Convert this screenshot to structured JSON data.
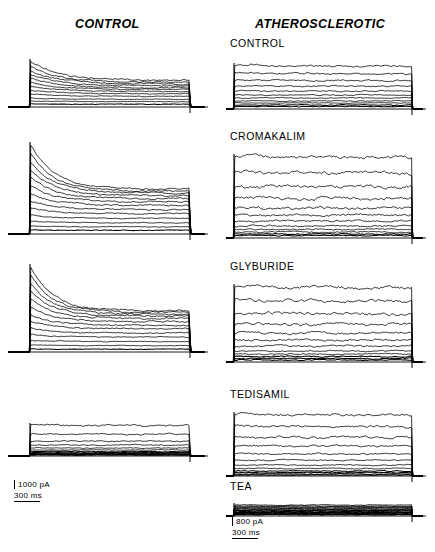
{
  "figure": {
    "width": 435,
    "height": 552,
    "background": "#ffffff",
    "ink": "#000000"
  },
  "headers": {
    "left": "CONTROL",
    "right": "ATHEROSCLEROTIC"
  },
  "panel_labels": {
    "right_control": "CONTROL",
    "right_cromakalim": "CROMAKALIM",
    "right_glyburide": "GLYBURIDE",
    "right_tedisamil": "TEDISAMIL",
    "right_tea": "TEA"
  },
  "scalebars": [
    {
      "id": "left-scalebar",
      "amplitude": "1000 pA",
      "time": "300 ms"
    },
    {
      "id": "right-scalebar",
      "amplitude": "800 pA",
      "time": "300 ms"
    }
  ],
  "chart_data": {
    "type": "line",
    "xlabel": "",
    "ylabel": "",
    "legend": "none",
    "grid": false,
    "series_units": {
      "current": "pA",
      "time": "ms"
    },
    "scale_reference": {
      "left_column": {
        "amplitude_pA": 1000,
        "time_ms": 300
      },
      "right_column": {
        "amplitude_pA": 800,
        "time_ms": 300
      }
    },
    "panels": [
      {
        "id": "left-control-1",
        "column": "CONTROL",
        "label": "",
        "x": 8,
        "y": 55,
        "w": 200,
        "h": 62,
        "baseline_y": 52,
        "step_x": 22,
        "end_x": 182,
        "tail_x": 196,
        "kind": "decay",
        "noise": 0.9,
        "peaks": [
          46,
          41,
          37,
          33,
          29,
          25,
          21,
          17,
          13,
          9,
          6,
          3
        ],
        "plateau_ratio": [
          0.58,
          0.6,
          0.62,
          0.64,
          0.66,
          0.7,
          0.74,
          0.78,
          0.82,
          0.86,
          0.9,
          0.94
        ],
        "decay_tau": 0.18
      },
      {
        "id": "left-control-2",
        "column": "CONTROL",
        "label": "",
        "x": 8,
        "y": 138,
        "w": 200,
        "h": 105,
        "baseline_y": 96,
        "step_x": 22,
        "end_x": 182,
        "tail_x": 196,
        "kind": "decay",
        "noise": 1.0,
        "peaks": [
          90,
          81,
          73,
          65,
          57,
          49,
          41,
          33,
          26,
          19,
          13,
          8,
          4
        ],
        "plateau_ratio": [
          0.5,
          0.53,
          0.56,
          0.59,
          0.62,
          0.66,
          0.7,
          0.74,
          0.78,
          0.82,
          0.86,
          0.9,
          0.94
        ],
        "decay_tau": 0.15
      },
      {
        "id": "left-control-3",
        "column": "CONTROL",
        "label": "",
        "x": 8,
        "y": 260,
        "w": 200,
        "h": 100,
        "baseline_y": 92,
        "step_x": 22,
        "end_x": 182,
        "tail_x": 196,
        "kind": "decay",
        "noise": 1.0,
        "peaks": [
          86,
          78,
          70,
          62,
          54,
          46,
          38,
          31,
          24,
          18,
          12,
          7,
          3
        ],
        "plateau_ratio": [
          0.48,
          0.51,
          0.54,
          0.58,
          0.62,
          0.66,
          0.7,
          0.75,
          0.79,
          0.83,
          0.87,
          0.91,
          0.95
        ],
        "decay_tau": 0.14
      },
      {
        "id": "left-control-4",
        "column": "CONTROL",
        "label": "",
        "x": 8,
        "y": 400,
        "w": 200,
        "h": 62,
        "baseline_y": 56,
        "step_x": 22,
        "end_x": 182,
        "tail_x": 196,
        "kind": "sustained",
        "noise": 1.3,
        "peaks": [
          31,
          22,
          15,
          11,
          8,
          6,
          4.5,
          3.5,
          2.5,
          2,
          1.5,
          1
        ],
        "plateau_ratio": [
          0.97,
          0.98,
          0.99,
          1.0,
          1.0,
          1.0,
          1.0,
          1.0,
          1.0,
          1.0,
          1.0,
          1.0
        ],
        "decay_tau": 0.9
      },
      {
        "id": "right-control",
        "column": "ATHEROSCLEROTIC",
        "label": "CONTROL",
        "x": 226,
        "y": 55,
        "w": 200,
        "h": 62,
        "baseline_y": 54,
        "step_x": 8,
        "end_x": 186,
        "tail_x": 196,
        "kind": "sustained",
        "noise": 1.2,
        "peaks": [
          44,
          36,
          29,
          23,
          18,
          14,
          11,
          8,
          6,
          4,
          2.5
        ],
        "plateau_ratio": [
          0.95,
          0.96,
          0.97,
          0.98,
          0.99,
          1.0,
          1.0,
          1.0,
          1.0,
          1.0,
          1.0
        ],
        "decay_tau": 0.8
      },
      {
        "id": "right-cromakalim",
        "column": "ATHEROSCLEROTIC",
        "label": "CROMAKALIM",
        "x": 226,
        "y": 148,
        "w": 200,
        "h": 98,
        "baseline_y": 90,
        "step_x": 8,
        "end_x": 186,
        "tail_x": 196,
        "kind": "sustained",
        "noise": 2.1,
        "peaks": [
          82,
          66,
          52,
          40,
          30,
          23,
          17,
          12,
          8.5,
          6,
          4,
          2.5
        ],
        "plateau_ratio": [
          0.97,
          0.98,
          0.98,
          0.99,
          1.0,
          1.0,
          1.0,
          1.0,
          1.0,
          1.0,
          1.0,
          1.0
        ],
        "decay_tau": 0.9
      },
      {
        "id": "right-glyburide",
        "column": "ATHEROSCLEROTIC",
        "label": "GLYBURIDE",
        "x": 226,
        "y": 278,
        "w": 200,
        "h": 92,
        "baseline_y": 84,
        "step_x": 8,
        "end_x": 186,
        "tail_x": 196,
        "kind": "sustained",
        "noise": 1.9,
        "peaks": [
          76,
          62,
          49,
          38,
          29,
          22,
          16,
          11,
          8,
          5.5,
          3.5,
          2
        ],
        "plateau_ratio": [
          0.96,
          0.97,
          0.98,
          0.99,
          1.0,
          1.0,
          1.0,
          1.0,
          1.0,
          1.0,
          1.0,
          1.0
        ],
        "decay_tau": 0.9
      },
      {
        "id": "right-tedisamil",
        "column": "ATHEROSCLEROTIC",
        "label": "TEDISAMIL",
        "x": 226,
        "y": 406,
        "w": 200,
        "h": 78,
        "baseline_y": 70,
        "step_x": 8,
        "end_x": 186,
        "tail_x": 196,
        "kind": "sustained",
        "noise": 1.5,
        "peaks": [
          62,
          50,
          39,
          30,
          22,
          16,
          11,
          7.5,
          5,
          3.5,
          2,
          1
        ],
        "plateau_ratio": [
          0.97,
          0.98,
          0.99,
          1.0,
          1.0,
          1.0,
          1.0,
          1.0,
          1.0,
          1.0,
          1.0,
          1.0
        ],
        "decay_tau": 0.9
      },
      {
        "id": "right-tea",
        "column": "ATHEROSCLEROTIC",
        "label": "TEA",
        "x": 226,
        "y": 498,
        "w": 200,
        "h": 26,
        "baseline_y": 18,
        "step_x": 8,
        "end_x": 186,
        "tail_x": 196,
        "kind": "sustained",
        "noise": 1.1,
        "peaks": [
          11,
          10,
          9.2,
          8.5,
          7.8,
          7.1,
          6.4,
          5.7,
          5,
          4.3,
          3.6,
          3,
          2.4,
          1.8,
          1.2
        ],
        "plateau_ratio": [
          1.0,
          1.0,
          1.0,
          1.0,
          1.0,
          1.0,
          1.0,
          1.0,
          1.0,
          1.0,
          1.0,
          1.0,
          1.0,
          1.0,
          1.0
        ],
        "decay_tau": 0.95
      }
    ]
  }
}
